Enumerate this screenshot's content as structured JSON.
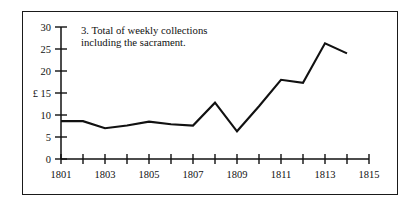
{
  "figure": {
    "border_color": "#1a1a1a",
    "background": "#ffffff"
  },
  "chart_data": {
    "type": "line",
    "title_lines": [
      "3. Total of weekly collections",
      "including the sacrament."
    ],
    "xlabel": "",
    "ylabel": "£",
    "currency_symbol": "£",
    "currency_symbol_at": 15,
    "xlim": [
      1801,
      1815
    ],
    "ylim": [
      0,
      30
    ],
    "x": [
      1801,
      1802,
      1803,
      1804,
      1805,
      1806,
      1807,
      1808,
      1809,
      1810,
      1811,
      1812,
      1813,
      1814
    ],
    "values": [
      8.6,
      8.6,
      7.0,
      7.6,
      8.5,
      7.9,
      7.6,
      12.8,
      6.3,
      12.0,
      18.0,
      17.3,
      26.3,
      24.0
    ],
    "series": [
      {
        "name": "Total of weekly collections including the sacrament",
        "values": [
          8.6,
          8.6,
          7.0,
          7.6,
          8.5,
          7.9,
          7.6,
          12.8,
          6.3,
          12.0,
          18.0,
          17.3,
          26.3,
          24.0
        ],
        "color": "#111111"
      }
    ],
    "y_ticks": [
      0,
      5,
      10,
      15,
      20,
      25,
      30
    ],
    "y_tick_labels": [
      "0",
      "5",
      "10",
      "£ 15",
      "20",
      "25",
      "30"
    ],
    "x_ticks": [
      1801,
      1802,
      1803,
      1804,
      1805,
      1806,
      1807,
      1808,
      1809,
      1810,
      1811,
      1812,
      1813,
      1814,
      1815
    ],
    "x_tick_labels": [
      "1801",
      "",
      "1803",
      "",
      "1805",
      "",
      "1807",
      "",
      "1809",
      "",
      "1811",
      "",
      "1813",
      "",
      "1815"
    ],
    "x_labeled_ticks": [
      "1801",
      "1803",
      "1805",
      "1807",
      "1809",
      "1811",
      "1813",
      "1815"
    ],
    "grid": false,
    "legend": false,
    "line_color": "#111111"
  }
}
